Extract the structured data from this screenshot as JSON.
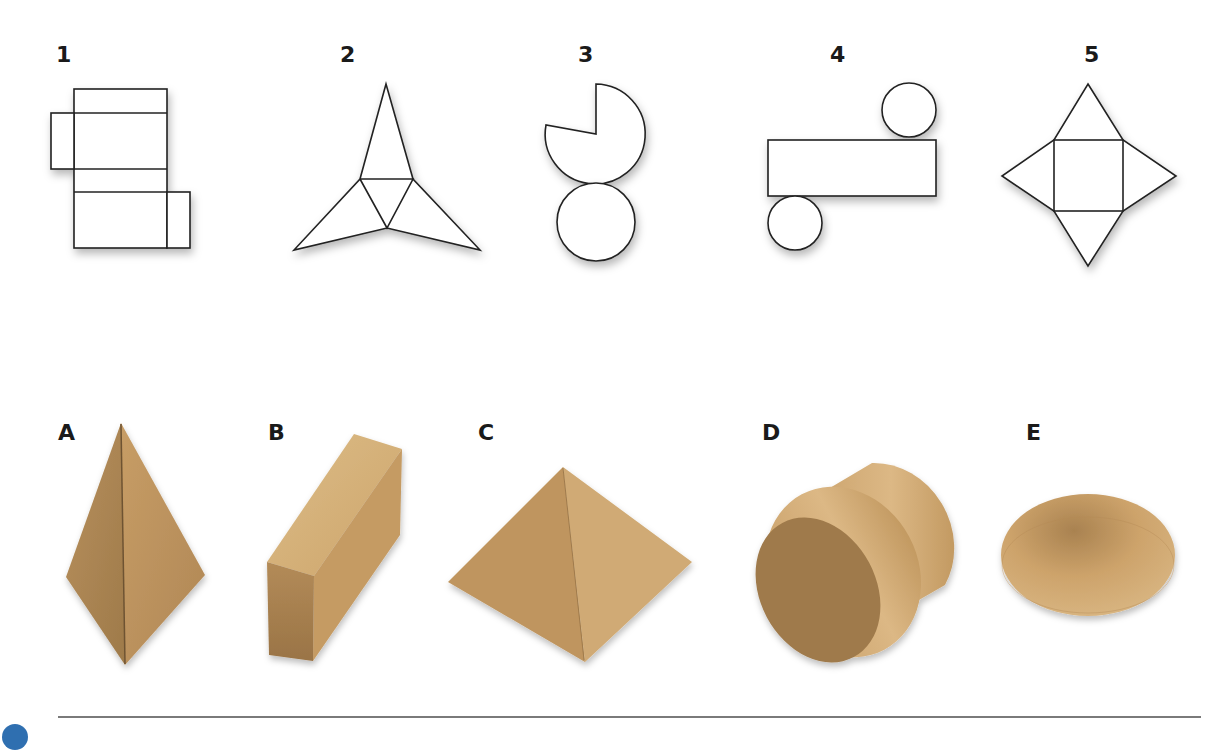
{
  "nets": {
    "title": "Nets",
    "items": [
      {
        "label": "1",
        "shape": "cuboid-net"
      },
      {
        "label": "2",
        "shape": "triangular-pyramid-net"
      },
      {
        "label": "3",
        "shape": "cone-net"
      },
      {
        "label": "4",
        "shape": "cylinder-net"
      },
      {
        "label": "5",
        "shape": "square-pyramid-net"
      }
    ]
  },
  "solids": {
    "title": "Solids",
    "items": [
      {
        "label": "A",
        "shape": "triangular-pyramid"
      },
      {
        "label": "B",
        "shape": "cuboid"
      },
      {
        "label": "C",
        "shape": "square-pyramid"
      },
      {
        "label": "D",
        "shape": "cylinder"
      },
      {
        "label": "E",
        "shape": "cone"
      }
    ]
  },
  "colors": {
    "wood_light": "#d9b27a",
    "wood_mid": "#c19660",
    "wood_dark": "#9c7446",
    "line": "#222222",
    "rule": "#7a7a7a",
    "accent_blue": "#2f6fb0"
  }
}
